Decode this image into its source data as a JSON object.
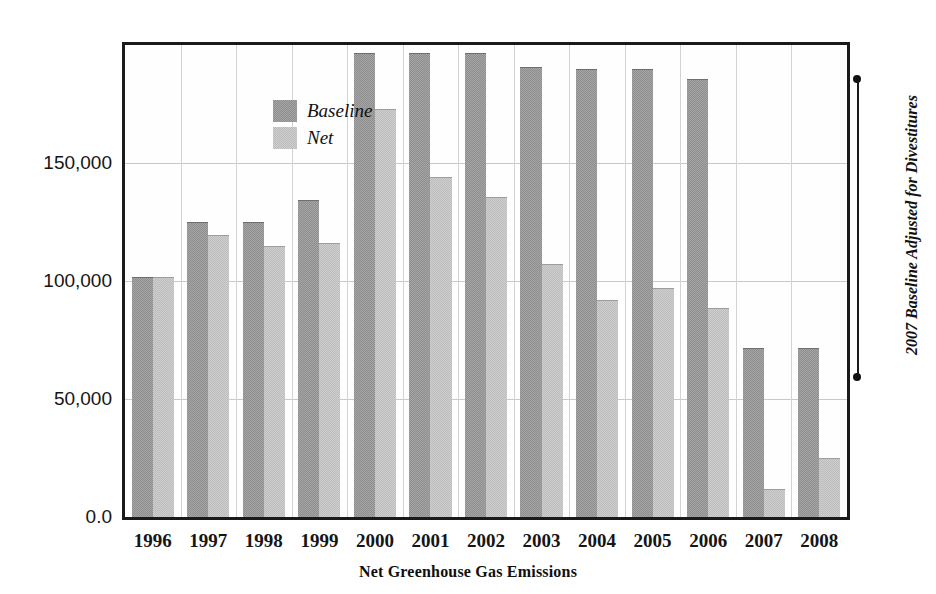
{
  "chart_data": {
    "type": "bar",
    "title": "",
    "xlabel": "Net Greenhouse Gas Emissions",
    "ylabel": "",
    "categories": [
      "1996",
      "1997",
      "1998",
      "1999",
      "2000",
      "2001",
      "2002",
      "2003",
      "2004",
      "2005",
      "2006",
      "2007",
      "2008"
    ],
    "series": [
      {
        "name": "Baseline",
        "color": "#8e8e8e",
        "values": [
          101500,
          125000,
          125000,
          134500,
          196500,
          196800,
          196800,
          190500,
          190000,
          190000,
          185500,
          71500,
          71500
        ]
      },
      {
        "name": "Net",
        "color": "#bcbcbc",
        "values": [
          101800,
          119500,
          115000,
          116000,
          173000,
          144000,
          135500,
          107000,
          92000,
          97000,
          88500,
          12000,
          25000
        ]
      }
    ],
    "ylim": [
      0,
      200000
    ],
    "yticks": [
      0,
      50000,
      100000,
      150000
    ],
    "ytick_labels": [
      "0.0",
      "50,000",
      "100,000",
      "150,000"
    ],
    "grid": true,
    "legend_position": "top-left",
    "annotations": [
      {
        "text": "2007 Baseline Adjusted for Divestitures",
        "orientation": "vertical",
        "position": "right"
      }
    ]
  },
  "legend": {
    "items": [
      {
        "label": "Baseline"
      },
      {
        "label": "Net"
      }
    ]
  },
  "axes": {
    "x_title": "Net Greenhouse Gas Emissions",
    "x_tick_labels": [
      "1996",
      "1997",
      "1998",
      "1999",
      "2000",
      "2001",
      "2002",
      "2003",
      "2004",
      "2005",
      "2006",
      "2007",
      "2008"
    ],
    "y_tick_labels": [
      "150,000",
      "100,000",
      "50,000",
      "0.0"
    ]
  },
  "annotation": {
    "text": "2007 Baseline Adjusted for Divestitures"
  },
  "colors": {
    "baseline": "#8e8e8e",
    "net": "#bcbcbc",
    "frame": "#1a1a1a",
    "grid": "#c9c9c9",
    "background": "#ffffff"
  }
}
